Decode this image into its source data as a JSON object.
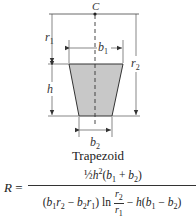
{
  "diagram": {
    "title": "Trapezoid",
    "center_label": "C",
    "labels": {
      "r1": "r",
      "r1_sub": "1",
      "r2": "r",
      "r2_sub": "2",
      "b1": "b",
      "b1_sub": "1",
      "b2": "b",
      "b2_sub": "2",
      "h": "h"
    },
    "colors": {
      "fill": "#c8c8c8",
      "stroke": "#333333"
    }
  },
  "formula": {
    "lhs": "R",
    "equals": "=",
    "numerator": {
      "coef": "½",
      "h": "h",
      "exp": "2",
      "open": "(",
      "b1": "b",
      "sub1": "1",
      "plus": " + ",
      "b2": "b",
      "sub2": "2",
      "close": ")"
    },
    "denominator": {
      "open": "(",
      "b1": "b",
      "b1s": "1",
      "r2": "r",
      "r2s": "2",
      "minus": " − ",
      "b2": "b",
      "b2s": "2",
      "r1": "r",
      "r1s": "1",
      "close": ")",
      "ln": " ln ",
      "frac_top": "r",
      "frac_top_sub": "2",
      "frac_bot": "r",
      "frac_bot_sub": "1",
      "minus2": " − ",
      "h": "h",
      "open2": "(",
      "b1b": "b",
      "b1bs": "1",
      "minus3": " − ",
      "b2b": "b",
      "b2bs": "2",
      "close2": ")"
    }
  }
}
